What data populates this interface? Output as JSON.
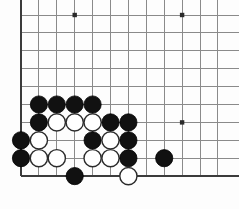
{
  "board": {
    "name": "go-board",
    "kind": "go-goban",
    "background_color": "#fdfdfd",
    "grid_color": "#8a8a8a",
    "edge_color": "#3b3b3b",
    "black_color": "#111111",
    "white_color": "#ffffff",
    "view": {
      "origin_x": 21,
      "origin_y": 15,
      "spacing": 17.9,
      "columns_visible": 12,
      "rows_visible": 10,
      "cropped_right": true,
      "cropped_top": true,
      "left_edge_shown": true,
      "bottom_edge_shown": true
    },
    "star_points": [
      {
        "col": 3,
        "row": 0
      },
      {
        "col": 9,
        "row": 0
      },
      {
        "col": 9,
        "row": 6
      }
    ],
    "stones": [
      {
        "color": "black",
        "col": 1,
        "row": 5
      },
      {
        "color": "black",
        "col": 2,
        "row": 5
      },
      {
        "color": "black",
        "col": 3,
        "row": 5
      },
      {
        "color": "black",
        "col": 4,
        "row": 5
      },
      {
        "color": "black",
        "col": 1,
        "row": 6
      },
      {
        "color": "white",
        "col": 2,
        "row": 6
      },
      {
        "color": "white",
        "col": 3,
        "row": 6
      },
      {
        "color": "white",
        "col": 4,
        "row": 6
      },
      {
        "color": "black",
        "col": 5,
        "row": 6
      },
      {
        "color": "black",
        "col": 6,
        "row": 6
      },
      {
        "color": "black",
        "col": 0,
        "row": 7
      },
      {
        "color": "white",
        "col": 1,
        "row": 7
      },
      {
        "color": "black",
        "col": 4,
        "row": 7
      },
      {
        "color": "white",
        "col": 5,
        "row": 7
      },
      {
        "color": "black",
        "col": 6,
        "row": 7
      },
      {
        "color": "black",
        "col": 0,
        "row": 8
      },
      {
        "color": "white",
        "col": 1,
        "row": 8
      },
      {
        "color": "white",
        "col": 2,
        "row": 8
      },
      {
        "color": "white",
        "col": 4,
        "row": 8
      },
      {
        "color": "white",
        "col": 5,
        "row": 8
      },
      {
        "color": "black",
        "col": 6,
        "row": 8
      },
      {
        "color": "black",
        "col": 8,
        "row": 8
      },
      {
        "color": "black",
        "col": 3,
        "row": 9
      },
      {
        "color": "white",
        "col": 6,
        "row": 9
      }
    ],
    "counts": {
      "black_stones": 14,
      "white_stones": 10,
      "total_stones": 24
    }
  }
}
